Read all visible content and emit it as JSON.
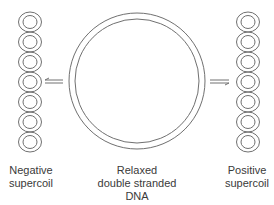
{
  "diagram": {
    "left": {
      "line1": "Negative",
      "line2": "supercoil"
    },
    "center": {
      "line1": "Relaxed",
      "line2": "double stranded",
      "line3": "DNA"
    },
    "right": {
      "line1": "Positive",
      "line2": "supercoil"
    },
    "stroke_color": "#6e6e6e",
    "text_color": "#3a3a3a"
  }
}
